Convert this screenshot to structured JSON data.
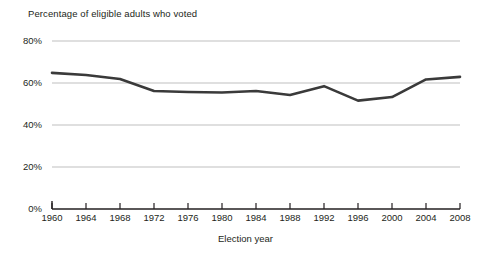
{
  "chart_data": {
    "type": "line",
    "title": "Percentage of eligible adults who voted",
    "xlabel": "Election year",
    "ylabel": "",
    "categories": [
      1960,
      1964,
      1968,
      1972,
      1976,
      1980,
      1984,
      1988,
      1992,
      1996,
      2000,
      2004,
      2008
    ],
    "x": [
      1960,
      1964,
      1968,
      1972,
      1976,
      1980,
      1984,
      1988,
      1992,
      1996,
      2000,
      2004,
      2008
    ],
    "values": [
      64.8,
      63.8,
      61.9,
      56.2,
      55.7,
      55.5,
      56.2,
      54.3,
      58.5,
      51.6,
      53.3,
      61.7,
      62.9
    ],
    "xlim": [
      1960,
      2008
    ],
    "ylim": [
      0,
      80
    ],
    "ytick_values": [
      0,
      20,
      40,
      60,
      80
    ],
    "ytick_labels": [
      "0%",
      "20%",
      "40%",
      "60%",
      "80%"
    ],
    "xtick_labels": [
      "1960",
      "1964",
      "1968",
      "1972",
      "1976",
      "1980",
      "1984",
      "1988",
      "1992",
      "1996",
      "2000",
      "2004",
      "2008"
    ],
    "grid": "horizontal",
    "legend": "none",
    "series_color": "#3a3a3a",
    "grid_color": "#bfbfbf",
    "axis_color": "#231f20"
  },
  "axis": {
    "x_title": "Election year"
  }
}
